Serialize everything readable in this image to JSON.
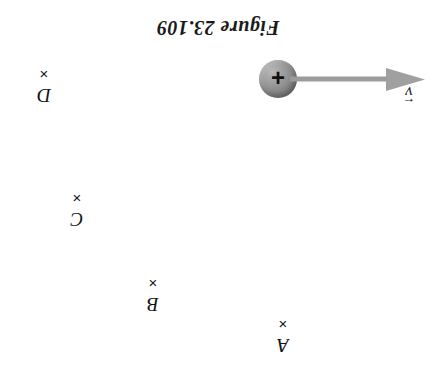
{
  "figure": {
    "title": "Figure 23.109",
    "background_color": "#ffffff",
    "orientation_note": "inverted",
    "particle": {
      "charge_sign": "+",
      "name": "positive-point-charge",
      "fill_color": "#8d8d8d",
      "diameter_px": 38,
      "center_x": 278,
      "center_y": 79
    },
    "velocity_vector": {
      "symbol": "v",
      "overbar": "←",
      "direction": "right",
      "color": "#9a9a9a",
      "tail_x": 290,
      "tip_x": 425,
      "y": 79
    },
    "points": [
      {
        "label": "D",
        "cross": "×",
        "x": 44,
        "y": 66
      },
      {
        "label": "C",
        "cross": "×",
        "x": 77,
        "y": 190
      },
      {
        "label": "B",
        "cross": "×",
        "x": 153,
        "y": 275
      },
      {
        "label": "A",
        "cross": "×",
        "x": 283,
        "y": 316
      }
    ]
  }
}
